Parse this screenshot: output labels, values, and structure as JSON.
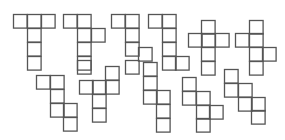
{
  "diagram": {
    "type": "cube-nets",
    "cell_size": 13.6,
    "stroke_color": "#555555",
    "background": "#ffffff",
    "nets": [
      {
        "id": 1,
        "cells": [
          [
            13,
            14
          ],
          [
            27,
            14
          ],
          [
            41,
            14
          ],
          [
            27,
            28
          ],
          [
            27,
            42
          ],
          [
            27,
            56
          ]
        ]
      },
      {
        "id": 2,
        "cells": [
          [
            63,
            14
          ],
          [
            77,
            14
          ],
          [
            77,
            28
          ],
          [
            91,
            28
          ],
          [
            77,
            42
          ],
          [
            77,
            56
          ],
          [
            77,
            60
          ]
        ]
      },
      {
        "id": 3,
        "cells": [
          [
            111,
            14
          ],
          [
            125,
            14
          ],
          [
            125,
            28
          ],
          [
            125,
            42
          ],
          [
            138,
            47
          ],
          [
            125,
            60
          ]
        ]
      },
      {
        "id": 4,
        "cells": [
          [
            148,
            14
          ],
          [
            162,
            14
          ],
          [
            162,
            28
          ],
          [
            162,
            42
          ],
          [
            162,
            56
          ],
          [
            175,
            56
          ]
        ]
      },
      {
        "id": 5,
        "cells": [
          [
            201,
            20
          ],
          [
            188,
            33
          ],
          [
            201,
            33
          ],
          [
            215,
            33
          ],
          [
            201,
            47
          ],
          [
            201,
            61
          ]
        ]
      },
      {
        "id": 6,
        "cells": [
          [
            249,
            20
          ],
          [
            235,
            33
          ],
          [
            249,
            33
          ],
          [
            249,
            47
          ],
          [
            262,
            47
          ],
          [
            249,
            61
          ]
        ]
      },
      {
        "id": 7,
        "cells": [
          [
            36,
            75
          ],
          [
            50,
            75
          ],
          [
            50,
            89
          ],
          [
            50,
            103
          ],
          [
            63,
            103
          ],
          [
            63,
            117
          ]
        ]
      },
      {
        "id": 8,
        "cells": [
          [
            105,
            66
          ],
          [
            79,
            80
          ],
          [
            92,
            80
          ],
          [
            105,
            80
          ],
          [
            92,
            94
          ],
          [
            92,
            108
          ]
        ]
      },
      {
        "id": 9,
        "cells": [
          [
            143,
            62
          ],
          [
            143,
            76
          ],
          [
            143,
            90
          ],
          [
            156,
            90
          ],
          [
            156,
            104
          ],
          [
            156,
            118
          ]
        ]
      },
      {
        "id": 10,
        "cells": [
          [
            182,
            77
          ],
          [
            182,
            91
          ],
          [
            196,
            91
          ],
          [
            196,
            105
          ],
          [
            209,
            105
          ],
          [
            196,
            118
          ]
        ]
      },
      {
        "id": 11,
        "cells": [
          [
            224,
            69
          ],
          [
            224,
            83
          ],
          [
            238,
            83
          ],
          [
            238,
            97
          ],
          [
            251,
            97
          ],
          [
            251,
            110
          ]
        ]
      }
    ]
  }
}
